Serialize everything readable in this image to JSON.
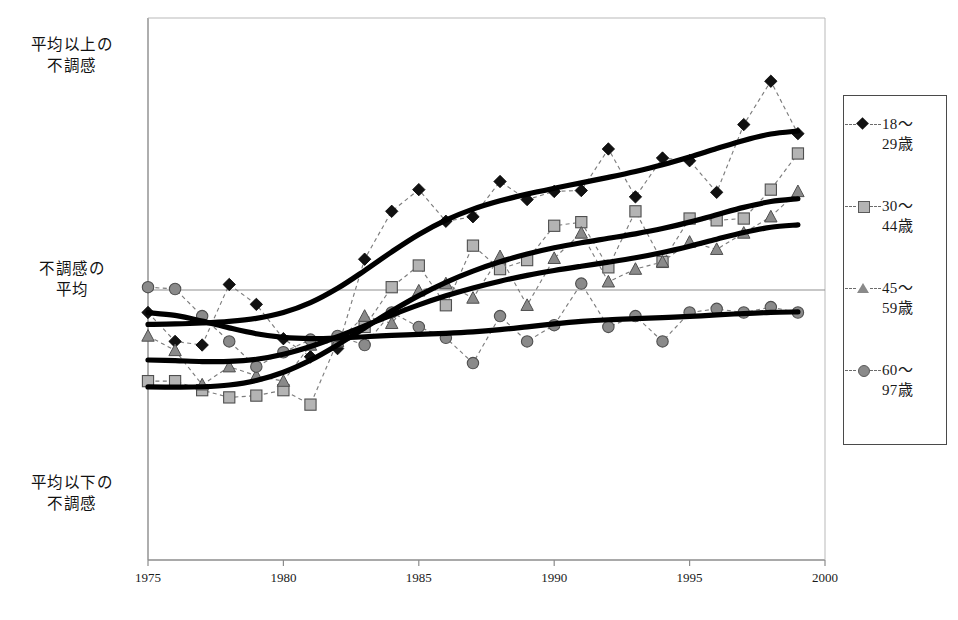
{
  "chart_data": {
    "type": "line",
    "title": "",
    "xlabel": "",
    "ylabel": "",
    "x": [
      1975,
      1976,
      1977,
      1978,
      1979,
      1980,
      1981,
      1982,
      1983,
      1984,
      1985,
      1986,
      1987,
      1988,
      1989,
      1990,
      1991,
      1992,
      1993,
      1994,
      1995,
      1996,
      1997,
      1998,
      1999
    ],
    "xlim": [
      1975,
      2000
    ],
    "ylim": [
      -3.0,
      3.0
    ],
    "xticks": [
      "1975",
      "1980",
      "1985",
      "1990",
      "1995",
      "2000"
    ],
    "yticks": [
      "平均以上の 不調感",
      "不調感の 平均",
      "平均以下の 不調感"
    ],
    "grid": false,
    "reference_line": {
      "label": "不調感の平均",
      "value": 0.0
    },
    "legend_position": "right-outside",
    "series": [
      {
        "name": "18～29歳",
        "label_line1": "18～",
        "label_line2": "29歳",
        "marker": "diamond",
        "marker_color": "#111111",
        "line_style": "dashed",
        "trend": "thick-black-smooth",
        "values": [
          -0.26,
          -0.58,
          -0.62,
          0.05,
          -0.17,
          -0.55,
          -0.75,
          -0.66,
          0.33,
          0.86,
          1.1,
          0.75,
          0.8,
          1.19,
          0.99,
          1.08,
          1.09,
          1.55,
          1.02,
          1.45,
          1.42,
          1.07,
          1.82,
          2.3,
          1.72
        ]
      },
      {
        "name": "30～44歳",
        "label_line1": "30～",
        "label_line2": "44歳",
        "marker": "square",
        "marker_color": "#b4b4b4",
        "line_style": "dashed",
        "trend": "thick-black-smooth",
        "values": [
          -1.02,
          -1.02,
          -1.12,
          -1.2,
          -1.18,
          -1.12,
          -1.28,
          -0.58,
          -0.42,
          0.02,
          0.26,
          -0.18,
          0.48,
          0.22,
          0.32,
          0.7,
          0.74,
          0.24,
          0.86,
          0.3,
          0.78,
          0.76,
          0.78,
          1.1,
          1.5
        ]
      },
      {
        "name": "45～59歳",
        "label_line1": "45～",
        "label_line2": "59歳",
        "marker": "triangle",
        "marker_color": "#8a8a8a",
        "line_style": "dashed",
        "trend": "thick-black-smooth",
        "values": [
          -0.52,
          -0.68,
          -1.06,
          -0.86,
          -0.96,
          -1.02,
          -0.62,
          -0.58,
          -0.3,
          -0.38,
          -0.02,
          0.06,
          -0.1,
          0.36,
          -0.18,
          0.34,
          0.62,
          0.08,
          0.22,
          0.3,
          0.52,
          0.44,
          0.62,
          0.8,
          1.08
        ]
      },
      {
        "name": "60～97歳",
        "label_line1": "60～",
        "label_line2": "97歳",
        "marker": "circle",
        "marker_color": "#8a8a8a",
        "line_style": "dashed",
        "trend": "thick-black-smooth",
        "values": [
          0.02,
          0.0,
          -0.3,
          -0.58,
          -0.86,
          -0.7,
          -0.56,
          -0.52,
          -0.62,
          -0.26,
          -0.42,
          -0.54,
          -0.82,
          -0.3,
          -0.58,
          -0.4,
          0.06,
          -0.42,
          -0.3,
          -0.58,
          -0.26,
          -0.22,
          -0.26,
          -0.2,
          -0.26
        ]
      }
    ]
  },
  "axis": {
    "y_top": {
      "line1": "平均以上の",
      "line2": "不調感"
    },
    "y_mid": {
      "line1": "不調感の",
      "line2": "平均"
    },
    "y_bottom": {
      "line1": "平均以下の",
      "line2": "不調感"
    }
  },
  "caption": {
    "text": ""
  }
}
